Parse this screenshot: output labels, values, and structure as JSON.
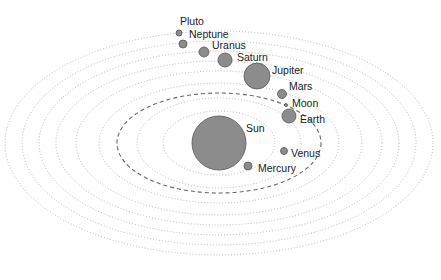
{
  "diagram": {
    "title": "",
    "center": {
      "x": 219,
      "y": 143
    },
    "orbits": [
      {
        "name": "mercury-orbit",
        "rx": 56,
        "ry": 32,
        "style": "dotted"
      },
      {
        "name": "venus-orbit",
        "rx": 82,
        "ry": 45,
        "style": "dotted"
      },
      {
        "name": "earth-orbit",
        "rx": 102,
        "ry": 50,
        "style": "dashed"
      },
      {
        "name": "mars-orbit",
        "rx": 120,
        "ry": 60,
        "style": "dotted"
      },
      {
        "name": "jupiter-orbit",
        "rx": 143,
        "ry": 72,
        "style": "dotted"
      },
      {
        "name": "saturn-orbit",
        "rx": 163,
        "ry": 82,
        "style": "dotted"
      },
      {
        "name": "uranus-orbit",
        "rx": 180,
        "ry": 92,
        "style": "dotted"
      },
      {
        "name": "neptune-orbit",
        "rx": 197,
        "ry": 102,
        "style": "dotted"
      },
      {
        "name": "pluto-orbit",
        "rx": 214,
        "ry": 112,
        "style": "dotted"
      }
    ],
    "bodies": [
      {
        "key": "sun",
        "label": "Sun",
        "cx": 219,
        "cy": 143,
        "r": 27,
        "lx": 246,
        "ly": 132
      },
      {
        "key": "mercury",
        "label": "Mercury",
        "cx": 248,
        "cy": 166,
        "r": 4,
        "lx": 258,
        "ly": 172
      },
      {
        "key": "venus",
        "label": "Venus",
        "cx": 284,
        "cy": 151,
        "r": 3.5,
        "lx": 291,
        "ly": 157
      },
      {
        "key": "earth",
        "label": "Earth",
        "cx": 289,
        "cy": 116,
        "r": 7,
        "lx": 300,
        "ly": 123
      },
      {
        "key": "moon",
        "label": "Moon",
        "cx": 286,
        "cy": 105,
        "r": 1.5,
        "lx": 292,
        "ly": 107
      },
      {
        "key": "mars",
        "label": "Mars",
        "cx": 282,
        "cy": 94,
        "r": 4.5,
        "lx": 289,
        "ly": 90
      },
      {
        "key": "jupiter",
        "label": "Jupiter",
        "cx": 257,
        "cy": 76,
        "r": 13,
        "lx": 272,
        "ly": 74
      },
      {
        "key": "saturn",
        "label": "Saturn",
        "cx": 225,
        "cy": 60,
        "r": 7,
        "lx": 237,
        "ly": 61
      },
      {
        "key": "uranus",
        "label": "Uranus",
        "cx": 204,
        "cy": 52,
        "r": 5,
        "lx": 212,
        "ly": 49
      },
      {
        "key": "neptune",
        "label": "Neptune",
        "cx": 183,
        "cy": 44,
        "r": 4,
        "lx": 189,
        "ly": 38
      },
      {
        "key": "pluto",
        "label": "Pluto",
        "cx": 179,
        "cy": 33,
        "r": 3,
        "lx": 180,
        "ly": 25
      }
    ],
    "colors": {
      "planet_fill": "#8c8c8c",
      "orbit": "#b8b8b8",
      "earth_orbit": "#666666",
      "text": "#222222"
    }
  }
}
